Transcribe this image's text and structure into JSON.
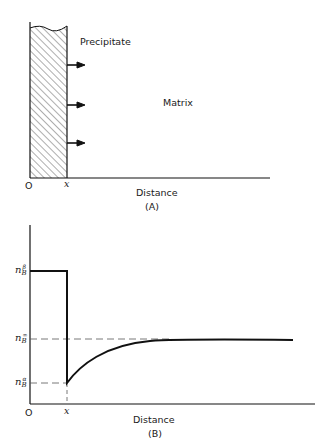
{
  "panel_a": {
    "caption": "(A)",
    "precipitate_label": "Precipitate",
    "matrix_label": "Matrix",
    "origin_label": "O",
    "interface_label": "x",
    "xlabel": "Distance",
    "arrow_count": 3
  },
  "panel_b": {
    "caption": "(B)",
    "origin_label": "O",
    "interface_label": "x",
    "xlabel": "Distance",
    "y_levels": [
      {
        "symbol": "n",
        "sub": "B",
        "sup": "β",
        "meaning": "concentration in precipitate"
      },
      {
        "symbol": "n",
        "sub": "B",
        "sup": "∞",
        "meaning": "far-field matrix concentration"
      },
      {
        "symbol": "n",
        "sub": "B",
        "sup": "α",
        "meaning": "matrix concentration at interface"
      }
    ]
  },
  "colors": {
    "line": "#111111",
    "background": "#ffffff",
    "dash": "#555555"
  }
}
